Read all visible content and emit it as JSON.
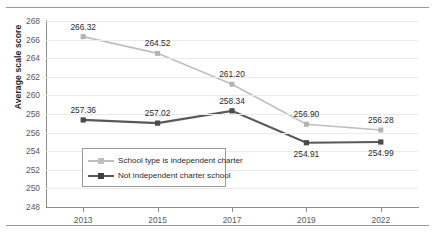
{
  "chart_data": {
    "type": "line",
    "title": "",
    "xlabel": "",
    "ylabel": "Average scale score",
    "categories": [
      "2013",
      "2015",
      "2017",
      "2019",
      "2022"
    ],
    "ylim": [
      248,
      268
    ],
    "ytick_step": 2,
    "yticks": [
      268,
      266,
      264,
      262,
      260,
      258,
      256,
      254,
      252,
      250,
      248
    ],
    "grid": true,
    "legend_position": "inside lower-left",
    "series": [
      {
        "name": "School type is independent charter",
        "color": "#bfbfbf",
        "marker": "square",
        "values": [
          266.32,
          264.52,
          261.2,
          256.9,
          256.28
        ],
        "labels": [
          "266.32",
          "264.52",
          "261.20",
          "256.90",
          "256.28"
        ],
        "label_position": "above"
      },
      {
        "name": "Not independent charter school",
        "color": "#595959",
        "marker": "square",
        "values": [
          257.36,
          257.02,
          258.34,
          254.91,
          254.99
        ],
        "labels": [
          "257.36",
          "257.02",
          "258.34",
          "254.91",
          "254.99"
        ],
        "label_position": "mixed"
      }
    ]
  },
  "axis": {
    "y_title": "Average scale score",
    "y_tick_labels": [
      "268",
      "266",
      "264",
      "262",
      "260",
      "258",
      "256",
      "254",
      "252",
      "250",
      "248"
    ],
    "x_tick_labels": [
      "2013",
      "2015",
      "2017",
      "2019",
      "2022"
    ]
  },
  "legend": {
    "entries": [
      {
        "label": "School type is independent charter",
        "color": "#bfbfbf"
      },
      {
        "label": "Not independent charter school",
        "color": "#595959"
      }
    ]
  },
  "data_labels": {
    "light": [
      "266.32",
      "264.52",
      "261.20",
      "256.90",
      "256.28"
    ],
    "dark": [
      "257.36",
      "257.02",
      "258.34",
      "254.91",
      "254.99"
    ]
  },
  "colors": {
    "series_light": "#bfbfbf",
    "series_dark": "#595959",
    "axis": "#8c8c8c",
    "grid": "#eaeaea",
    "rule": "#9a9a9a"
  }
}
